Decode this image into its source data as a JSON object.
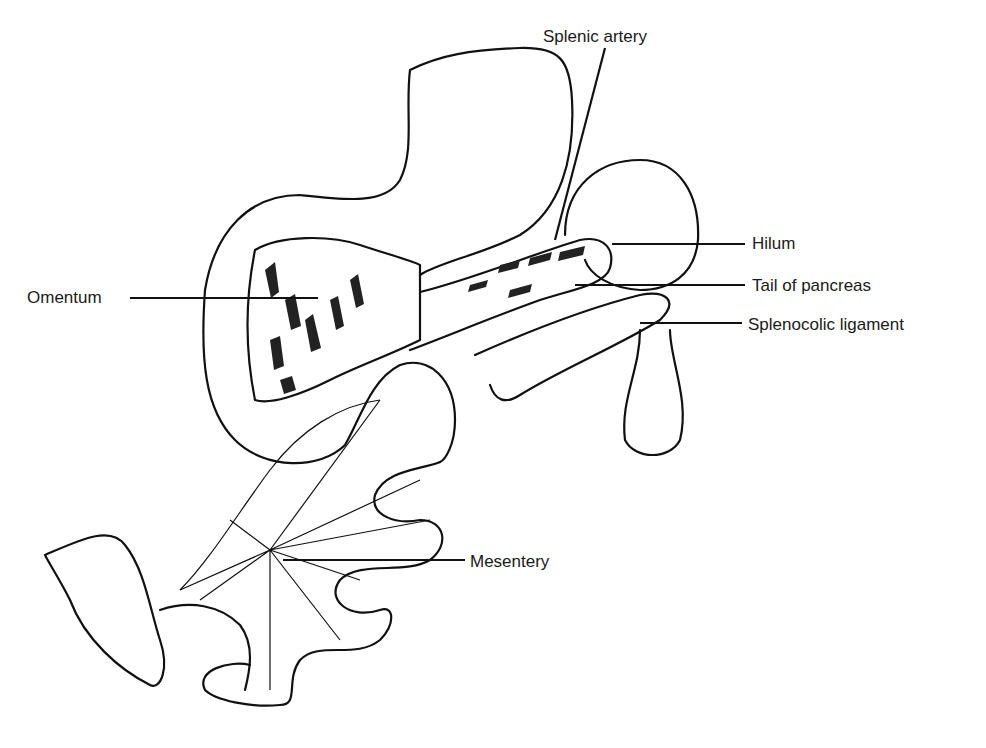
{
  "diagram": {
    "type": "anatomical illustration",
    "labels": [
      {
        "id": "splenic-artery",
        "text": "Splenic artery",
        "x": 543,
        "y": 28
      },
      {
        "id": "hilum",
        "text": "Hilum",
        "x": 752,
        "y": 234
      },
      {
        "id": "tail-of-pancreas",
        "text": "Tail of pancreas",
        "x": 752,
        "y": 276
      },
      {
        "id": "splenocolic-ligament",
        "text": "Splenocolic ligament",
        "x": 748,
        "y": 316
      },
      {
        "id": "omentum",
        "text": "Omentum",
        "x": 27,
        "y": 288
      },
      {
        "id": "mesentery",
        "text": "Mesentery",
        "x": 470,
        "y": 553
      }
    ]
  }
}
